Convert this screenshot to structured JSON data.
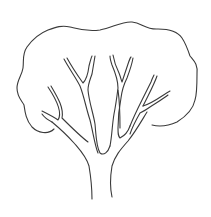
{
  "image": {
    "subject": "tree line drawing",
    "background_color": "#ffffff",
    "stroke_color": "#3a3a3a",
    "stroke_width": 1.1,
    "parts": [
      "canopy-outline",
      "trunk",
      "branches"
    ]
  }
}
